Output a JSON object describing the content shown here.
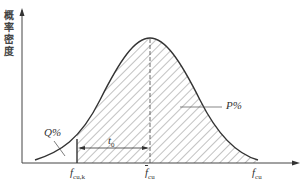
{
  "diagram": {
    "type": "normal-distribution",
    "y_axis_label": "概率密度",
    "labels": {
      "p_percent": "P%",
      "q_percent": "Q%",
      "t0": "t",
      "t0_sub": "0",
      "fcuk": "f",
      "fcuk_sub": "cu,k",
      "fcu_mean": "f",
      "fcu_mean_sub": "cu",
      "fcu": "f",
      "fcu_sub": "cu"
    },
    "colors": {
      "line": "#333333",
      "hatch": "#555555"
    }
  }
}
